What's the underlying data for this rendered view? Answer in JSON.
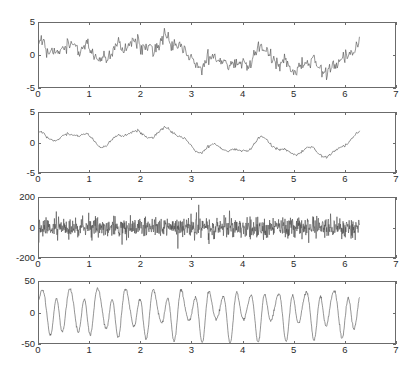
{
  "figure": {
    "title": "",
    "background": "#ffffff",
    "trace_color": "#4a4a4a",
    "axis_color": "#6b6b6b",
    "width": 410,
    "height": 369
  },
  "chart_data": [
    {
      "type": "line",
      "name": "subplot-1",
      "title": "",
      "xlabel": "",
      "ylabel": "",
      "xlim": [
        0,
        7
      ],
      "ylim": [
        -5,
        5
      ],
      "xticks": [
        0,
        1,
        2,
        3,
        4,
        5,
        6,
        7
      ],
      "yticks": [
        -5,
        0,
        5
      ],
      "xtick_labels": [
        "0",
        "1",
        "2",
        "3",
        "4",
        "5",
        "6",
        "7"
      ],
      "ytick_labels": [
        "-5",
        "0",
        "5"
      ],
      "grid": false,
      "legend": "none",
      "data_x_range": [
        0,
        6.3
      ],
      "description": "noisy multi-tone signal, amplitude about +/-3",
      "series": [
        {
          "name": "signal",
          "color": "#4a4a4a",
          "generator": {
            "kind": "sum-of-sines-plus-noise",
            "components": [
              {
                "amp": 1.4,
                "freq": 1.0,
                "phase": 0.0
              },
              {
                "amp": 1.0,
                "freq": 3.0,
                "phase": 0.8
              },
              {
                "amp": 0.8,
                "freq": 7.0,
                "phase": 2.1
              },
              {
                "amp": 0.5,
                "freq": 13.0,
                "phase": 1.3
              },
              {
                "amp": 0.35,
                "freq": 21.0,
                "phase": 0.4
              }
            ],
            "noise_amp": 0.55,
            "samples": 420,
            "seed": 17
          }
        }
      ]
    },
    {
      "type": "line",
      "name": "subplot-2",
      "title": "",
      "xlabel": "",
      "ylabel": "",
      "xlim": [
        0,
        7
      ],
      "ylim": [
        -5,
        5
      ],
      "xticks": [
        0,
        1,
        2,
        3,
        4,
        5,
        6,
        7
      ],
      "yticks": [
        -5,
        0,
        5
      ],
      "xtick_labels": [
        "0",
        "1",
        "2",
        "3",
        "4",
        "5",
        "6",
        "7"
      ],
      "ytick_labels": [
        "-5",
        "0",
        "5"
      ],
      "grid": false,
      "legend": "none",
      "data_x_range": [
        0,
        6.3
      ],
      "description": "smoothed / filtered version of signal, amplitude about +/-2.5",
      "series": [
        {
          "name": "filtered-signal",
          "color": "#4a4a4a",
          "generator": {
            "kind": "sum-of-sines-plus-noise",
            "components": [
              {
                "amp": 1.3,
                "freq": 1.0,
                "phase": 0.0
              },
              {
                "amp": 0.95,
                "freq": 3.0,
                "phase": 0.8
              },
              {
                "amp": 0.75,
                "freq": 7.0,
                "phase": 2.1
              },
              {
                "amp": 0.45,
                "freq": 13.0,
                "phase": 1.3
              }
            ],
            "noise_amp": 0.12,
            "samples": 420,
            "seed": 17
          }
        }
      ]
    },
    {
      "type": "line",
      "name": "subplot-3",
      "title": "",
      "xlabel": "",
      "ylabel": "",
      "xlim": [
        0,
        7
      ],
      "ylim": [
        -200,
        200
      ],
      "xticks": [
        0,
        1,
        2,
        3,
        4,
        5,
        6,
        7
      ],
      "yticks": [
        -200,
        0,
        200
      ],
      "xtick_labels": [
        "0",
        "1",
        "2",
        "3",
        "4",
        "5",
        "6",
        "7"
      ],
      "ytick_labels": [
        "-200",
        "0",
        "200"
      ],
      "grid": false,
      "legend": "none",
      "data_x_range": [
        0,
        6.3
      ],
      "description": "high frequency noise centered at zero with occasional tall spikes",
      "series": [
        {
          "name": "noise-with-spikes",
          "color": "#4a4a4a",
          "generator": {
            "kind": "dense-noise",
            "noise_amp": 34,
            "spike_amp": 150,
            "spike_count": 9,
            "samples": 1000,
            "seed": 91
          }
        }
      ]
    },
    {
      "type": "line",
      "name": "subplot-4",
      "title": "",
      "xlabel": "",
      "ylabel": "",
      "xlim": [
        0,
        7
      ],
      "ylim": [
        -50,
        50
      ],
      "xticks": [
        0,
        1,
        2,
        3,
        4,
        5,
        6,
        7
      ],
      "yticks": [
        -50,
        0,
        50
      ],
      "xtick_labels": [
        "0",
        "1",
        "2",
        "3",
        "4",
        "5",
        "6",
        "7"
      ],
      "ytick_labels": [
        "-50",
        "0",
        "50"
      ],
      "grid": false,
      "legend": "none",
      "data_x_range": [
        0,
        6.3
      ],
      "description": "clean periodic oscillation, roughly 23 cycles, clipped near +/-45",
      "series": [
        {
          "name": "oscillation",
          "color": "#4a4a4a",
          "generator": {
            "kind": "beating-sines",
            "components": [
              {
                "amp": 30.0,
                "freq": 23.0,
                "phase": 0.0
              },
              {
                "amp": 14.0,
                "freq": 11.0,
                "phase": 1.2
              },
              {
                "amp": 6.0,
                "freq": 34.0,
                "phase": 2.4
              }
            ],
            "noise_amp": 1.2,
            "samples": 900,
            "seed": 5
          }
        }
      ]
    }
  ]
}
